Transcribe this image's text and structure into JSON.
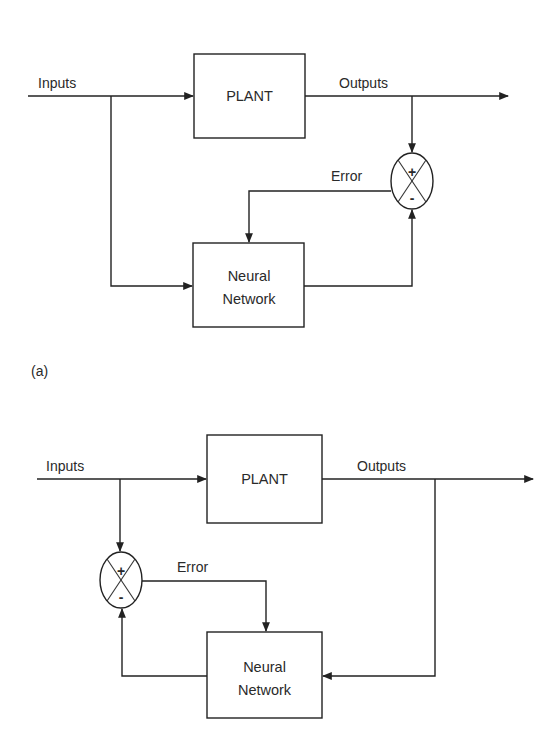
{
  "diagrams": [
    {
      "id": "a",
      "caption": "(a)",
      "plant_label": "PLANT",
      "nn_label_line1": "Neural",
      "nn_label_line2": "Network",
      "inputs_label": "Inputs",
      "outputs_label": "Outputs",
      "error_label": "Error",
      "sum_plus": "+",
      "sum_minus": "-"
    },
    {
      "id": "b",
      "caption": "",
      "plant_label": "PLANT",
      "nn_label_line1": "Neural",
      "nn_label_line2": "Network",
      "inputs_label": "Inputs",
      "outputs_label": "Outputs",
      "error_label": "Error",
      "sum_plus": "+",
      "sum_minus": "-"
    }
  ],
  "colors": {
    "line": "#222222",
    "background": "#ffffff",
    "text": "#2a2a2a"
  }
}
